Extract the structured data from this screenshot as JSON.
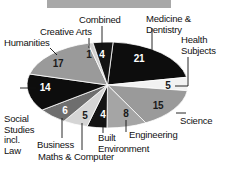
{
  "banner": {
    "name": "title-bar",
    "color": "#a8a8a8"
  },
  "chart_data": {
    "type": "pie",
    "title": "",
    "subtitle": "",
    "xlabel": "",
    "ylabel": "",
    "legend_position": "none",
    "grid": false,
    "total": 100,
    "units": "percent",
    "categories": [
      "Medicine & Dentistry",
      "Health Subjects",
      "Science",
      "Engineering",
      "Built Environment",
      "Maths & Computer",
      "Business",
      "Social Studies incl. Law",
      "Humanities",
      "Creative Arts",
      "Combined"
    ],
    "values": [
      21,
      5,
      15,
      8,
      4,
      5,
      6,
      14,
      17,
      1,
      4
    ],
    "colors": [
      "#0d0d0d",
      "#f2f2f2",
      "#9a9a9a",
      "#a5a5a5",
      "#141414",
      "#d5d5d5",
      "#6e6e6e",
      "#0d0d0d",
      "#9a9a9a",
      "#cfcfcf",
      "#141414"
    ],
    "slices": [
      {
        "label": "Medicine & Dentistry",
        "value": 21,
        "value_text": "21",
        "color": "#0d0d0d",
        "value_on_dark": true,
        "value_x": 139,
        "value_y": 59,
        "label_x": 146,
        "label_y": 14,
        "label_align": "left",
        "leader": {
          "x1": 152,
          "y1": 28,
          "x2": 152,
          "y2": 50
        }
      },
      {
        "label": "Health\nSubjects",
        "value": 5,
        "value_text": "5",
        "color": "#f2f2f2",
        "value_on_dark": false,
        "value_x": 168,
        "value_y": 86,
        "label_x": 181,
        "label_y": 35,
        "label_align": "left",
        "leader": {
          "x1": 188,
          "y1": 57,
          "x2": 188,
          "y2": 86,
          "x3": 175,
          "y3": 86
        }
      },
      {
        "label": "Science",
        "value": 15,
        "value_text": "15",
        "color": "#9a9a9a",
        "value_on_dark": false,
        "value_x": 158,
        "value_y": 106,
        "label_x": 180,
        "label_y": 116,
        "label_align": "left",
        "leader": {
          "x1": 176,
          "y1": 113,
          "x2": 186,
          "y2": 113
        }
      },
      {
        "label": "Engineering",
        "value": 8,
        "value_text": "8",
        "color": "#a5a5a5",
        "value_on_dark": false,
        "value_x": 126,
        "value_y": 114,
        "label_x": 129,
        "label_y": 130,
        "label_align": "left",
        "leader": {
          "x1": 126,
          "y1": 120,
          "x2": 126,
          "y2": 132
        }
      },
      {
        "label": "Built\nEnvironment",
        "value": 4,
        "value_text": "4",
        "color": "#141414",
        "value_on_dark": true,
        "value_x": 103,
        "value_y": 115,
        "label_x": 98,
        "label_y": 133,
        "label_align": "left",
        "leader": {
          "x1": 103,
          "y1": 122,
          "x2": 103,
          "y2": 133
        }
      },
      {
        "label": "Maths & Computer",
        "value": 5,
        "value_text": "5",
        "color": "#d5d5d5",
        "value_on_dark": false,
        "value_x": 85,
        "value_y": 116,
        "label_x": 38,
        "label_y": 152,
        "label_align": "left",
        "leader": {
          "x1": 82,
          "y1": 123,
          "x2": 82,
          "y2": 150
        }
      },
      {
        "label": "Business",
        "value": 6,
        "value_text": "6",
        "color": "#6e6e6e",
        "value_on_dark": true,
        "value_x": 65,
        "value_y": 111,
        "label_x": 37,
        "label_y": 140,
        "label_align": "left",
        "leader": {
          "x1": 62,
          "y1": 118,
          "x2": 62,
          "y2": 138
        }
      },
      {
        "label": "Social\nStudies\nincl.\nLaw",
        "value": 14,
        "value_text": "14",
        "color": "#0d0d0d",
        "value_on_dark": true,
        "value_x": 45,
        "value_y": 88,
        "label_x": 4,
        "label_y": 114,
        "label_align": "left",
        "leader": {
          "x1": 20,
          "y1": 88,
          "x2": 36,
          "y2": 88
        }
      },
      {
        "label": "Humanities",
        "value": 17,
        "value_text": "17",
        "color": "#9a9a9a",
        "value_on_dark": false,
        "value_x": 58,
        "value_y": 64,
        "label_x": 4,
        "label_y": 38,
        "label_align": "left",
        "leader": {
          "x1": 50,
          "y1": 48,
          "x2": 57,
          "y2": 55
        }
      },
      {
        "label": "Creative Arts",
        "value": 1,
        "value_text": "1",
        "color": "#cfcfcf",
        "value_on_dark": false,
        "value_x": 89,
        "value_y": 55,
        "label_x": 40,
        "label_y": 27,
        "label_align": "left",
        "leader": {
          "x1": 89,
          "y1": 38,
          "x2": 89,
          "y2": 48
        }
      },
      {
        "label": "Combined",
        "value": 4,
        "value_text": "4",
        "color": "#141414",
        "value_on_dark": true,
        "value_x": 102,
        "value_y": 55,
        "label_x": 79,
        "label_y": 15,
        "label_align": "left",
        "leader": {
          "x1": 102,
          "y1": 26,
          "x2": 102,
          "y2": 48
        }
      }
    ]
  }
}
